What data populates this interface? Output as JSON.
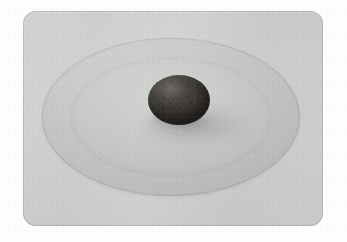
{
  "image": {
    "kind": "photograph",
    "subject": "dark ellipsoidal stone resting on a shallow round dish",
    "width": 347,
    "height": 242,
    "alt_text": "A dark gray-brown ellipsoidal stone sits at the center of a large shallow light-gray circular dish on a gray rounded-corner surface, surrounded by a white border."
  },
  "matte": {
    "name": "white-border",
    "color": "#fdfdfd"
  },
  "panel": {
    "name": "gray-backdrop-panel",
    "color": "#cdcfcc",
    "edge_color": "#96989 6",
    "corner_radius_px": 13,
    "left_px": 23,
    "top_px": 11,
    "width_px": 300,
    "height_px": 215
  },
  "disc": {
    "name": "shallow-round-dish",
    "color": "#c7c9c6",
    "rim_color": "#b5b7b4",
    "center_x_px": 171,
    "center_y_px": 117,
    "width_px": 258,
    "height_px": 158
  },
  "stone": {
    "name": "dark-ellipsoid-stone",
    "color": "#474340",
    "shadow_color": "#6a6c6a",
    "highlight_color": "#b2aca6",
    "center_x_px": 179,
    "center_y_px": 100,
    "width_px": 62,
    "height_px": 50
  },
  "lighting": {
    "key_direction": "upper-left",
    "cast_shadow_direction": "lower-right"
  }
}
